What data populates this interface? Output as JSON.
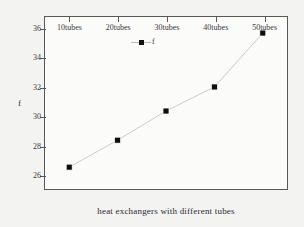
{
  "chart_data": {
    "type": "line",
    "title": "",
    "xlabel": "heat exchangers with different tubes",
    "ylabel": "f",
    "categories": [
      "10tubes",
      "20tubes",
      "30tubes",
      "40tubes",
      "50tubes"
    ],
    "values": [
      26.5,
      28.35,
      30.35,
      32.0,
      35.7
    ],
    "series": [
      {
        "name": "f",
        "values": [
          26.5,
          28.35,
          30.35,
          32.0,
          35.7
        ]
      }
    ],
    "ylim": [
      25.0,
      36.8
    ],
    "yticks": [
      26,
      28,
      30,
      32,
      34,
      36
    ],
    "ytick_labels": [
      "26",
      "28",
      "30",
      "32",
      "34",
      "36"
    ],
    "grid": false,
    "legend": {
      "position": "upper-center",
      "entries": [
        "f"
      ]
    },
    "marker": "square",
    "marker_color": "#0d0d0d",
    "line_color": "#c9c9c9"
  },
  "legend": {
    "label": "f"
  },
  "axes": {
    "x_title": "heat exchangers with different tubes",
    "y_title": "f"
  }
}
